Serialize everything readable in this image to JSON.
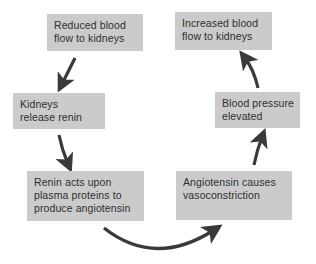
{
  "diagram": {
    "type": "cycle-flowchart",
    "colors": {
      "box_fill": "#cbcbcb",
      "text": "#2e2e2e",
      "arrow": "#3a3a3a",
      "background": "#ffffff"
    },
    "nodes": [
      {
        "id": "reduced-flow",
        "lines": [
          "Reduced blood",
          "flow to kidneys"
        ]
      },
      {
        "id": "kidneys-renin",
        "lines": [
          "Kidneys",
          "release renin"
        ]
      },
      {
        "id": "renin-acts",
        "lines": [
          "Renin acts upon",
          "plasma proteins to",
          "produce angiotensin"
        ]
      },
      {
        "id": "vasoconstriction",
        "lines": [
          "Angiotensin causes",
          "vasoconstriction"
        ]
      },
      {
        "id": "bp-elevated",
        "lines": [
          "Blood pressure",
          "elevated"
        ]
      },
      {
        "id": "increased-flow",
        "lines": [
          "Increased blood",
          "flow to kidneys"
        ]
      }
    ],
    "edges": [
      {
        "from": "reduced-flow",
        "to": "kidneys-renin"
      },
      {
        "from": "kidneys-renin",
        "to": "renin-acts"
      },
      {
        "from": "renin-acts",
        "to": "vasoconstriction"
      },
      {
        "from": "vasoconstriction",
        "to": "bp-elevated"
      },
      {
        "from": "bp-elevated",
        "to": "increased-flow"
      }
    ]
  }
}
